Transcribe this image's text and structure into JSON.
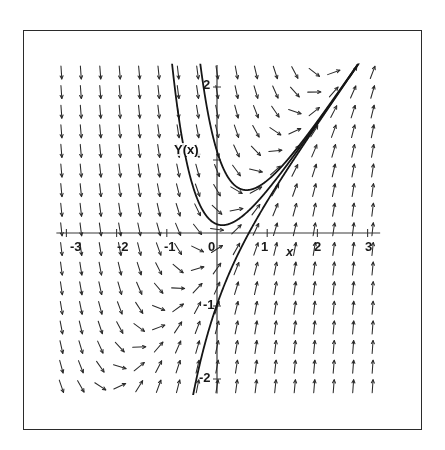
{
  "figure": {
    "title": "",
    "background_color": "#ffffff",
    "frame_color": "#2b2b2b",
    "ink_color": "#1a1a1a"
  },
  "annotations": {
    "solution_curve_label": "Y(x)",
    "x_axis_name": "x",
    "y_axis_name": ""
  },
  "axes": {
    "x_tick_labels": [
      "-3",
      "-2",
      "-1",
      "0",
      "1",
      "2",
      "3"
    ],
    "y_tick_labels": [
      "2",
      "1",
      "0",
      "-1",
      "-2"
    ],
    "x_label_zero": "0"
  },
  "chart_data": {
    "type": "line",
    "title": "",
    "xlabel": "x",
    "ylabel": "Y(x)",
    "xlim": [
      -3.35,
      3.35
    ],
    "ylim": [
      -2.25,
      2.35
    ],
    "xticks": [
      -3,
      -2,
      -1,
      0,
      1,
      2,
      3
    ],
    "yticks": [
      -2,
      -1,
      0,
      1,
      2
    ],
    "grid": false,
    "legend": "none",
    "plot_kind": "direction-field-with-solution-curves",
    "equation": "y' = 2*(x - y)",
    "direction_field": {
      "description": "Grid of short arrow segments showing slope y' = 2*(x - y) at each sample point",
      "x_samples": 17,
      "y_samples": 17,
      "x_range": [
        -3.1,
        3.1
      ],
      "y_range": [
        -2.1,
        2.2
      ],
      "arrow_length_px": 13,
      "arrow_color": "#2a2a2a",
      "arrowhead": true
    },
    "series": [
      {
        "name": "solution-curve-1",
        "label": "Y(x)",
        "comment": "Upper solution curve, minimum near (-0.35, 0.9)",
        "c": 1.62,
        "vertex": [
          -0.35,
          0.9
        ]
      },
      {
        "name": "solution-curve-2",
        "label": "",
        "comment": "Middle solution curve, passes through origin region, minimum near (0.15, 0.02)",
        "c": 0.62,
        "vertex": [
          0.15,
          0.02
        ]
      },
      {
        "name": "solution-curve-3",
        "label": "",
        "comment": "Lower solution curve, minimum near (1.1, -1.55)",
        "c": -0.48,
        "vertex": [
          1.1,
          -1.55
        ]
      }
    ],
    "curve_family": {
      "form": "y = x - 0.5 + C*exp(-2x)",
      "C_values": [
        1.62,
        0.62,
        -0.48
      ]
    }
  }
}
